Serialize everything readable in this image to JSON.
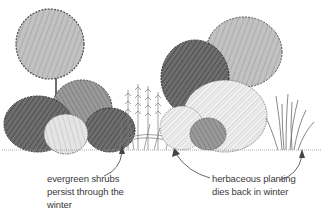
{
  "illustration": {
    "subject": "garden border with evergreen shrubs and herbaceous planting",
    "colors": {
      "ink": "#2a2a2a",
      "dark_foliage": "#5a5a5a",
      "mid_foliage": "#8c8c8c",
      "light_foliage": "#b9b9b9",
      "pale_foliage": "#d6d6d6",
      "background": "#ffffff",
      "text": "#3a3a3a"
    }
  },
  "annotations": [
    {
      "id": "evergreen",
      "lines": [
        "evergreen shrubs",
        "persist through the",
        "winter"
      ],
      "arrow_target": "evergreen shrubs group (left)"
    },
    {
      "id": "herbaceous",
      "lines": [
        "herbaceous planting",
        "dies back in winter"
      ],
      "arrow_targets": [
        "perennials (centre-left)",
        "grasses (right)"
      ]
    }
  ]
}
